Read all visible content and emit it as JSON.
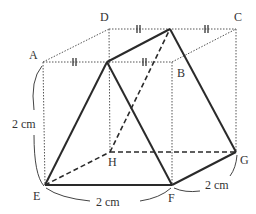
{
  "figure": {
    "type": "cube-with-inscribed-solid",
    "vertices": {
      "A": "A",
      "B": "B",
      "C": "C",
      "D": "D",
      "E": "E",
      "F": "F",
      "G": "G",
      "H": "H"
    },
    "dimensions": {
      "height": "2 cm",
      "width": "2 cm",
      "depth": "2 cm"
    },
    "tick_marks": "equal-segment marks (||) on edges AB and DC indicating midpoints"
  },
  "colors": {
    "edge": "#555555",
    "solid": "#2a2a2a",
    "text": "#333333"
  }
}
